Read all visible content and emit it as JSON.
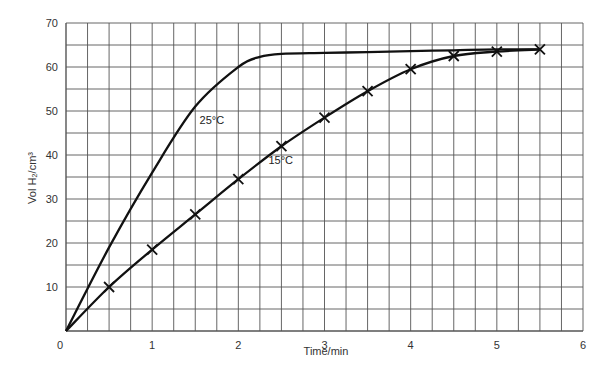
{
  "chart_data": {
    "type": "line",
    "title": "",
    "xlabel": "Time/min",
    "ylabel": "Vol H₂/cm³",
    "xlim": [
      0,
      6
    ],
    "ylim": [
      0,
      70
    ],
    "grid": true,
    "x_ticks": [
      0,
      1,
      2,
      3,
      4,
      5,
      6
    ],
    "y_ticks": [
      10,
      20,
      30,
      40,
      50,
      60,
      70
    ],
    "origin_label": "0",
    "series": [
      {
        "name": "25°C",
        "marker": "none",
        "x": [
          0,
          0.5,
          1,
          1.5,
          2,
          2.25,
          2.5,
          3,
          3.5,
          4,
          4.5,
          5,
          5.5
        ],
        "values": [
          0,
          19,
          36,
          51,
          60,
          62.3,
          63,
          63.2,
          63.4,
          63.6,
          63.8,
          64,
          64
        ],
        "label_pos": {
          "x": 1.55,
          "y": 47
        }
      },
      {
        "name": "15°C",
        "marker": "x",
        "x": [
          0,
          0.5,
          1,
          1.5,
          2,
          2.5,
          3,
          3.5,
          4,
          4.5,
          5,
          5.5
        ],
        "values": [
          0,
          10,
          18.5,
          26.5,
          34.5,
          42,
          48.5,
          54.5,
          59.5,
          62.5,
          63.5,
          64
        ],
        "marker_x": [
          0.5,
          1,
          1.5,
          2,
          2.5,
          3,
          3.5,
          4,
          4.5,
          5,
          5.5
        ],
        "label_pos": {
          "x": 2.35,
          "y": 38
        }
      }
    ]
  },
  "colors": {
    "grid": "#555555",
    "line": "#111111",
    "background": "#ffffff"
  }
}
